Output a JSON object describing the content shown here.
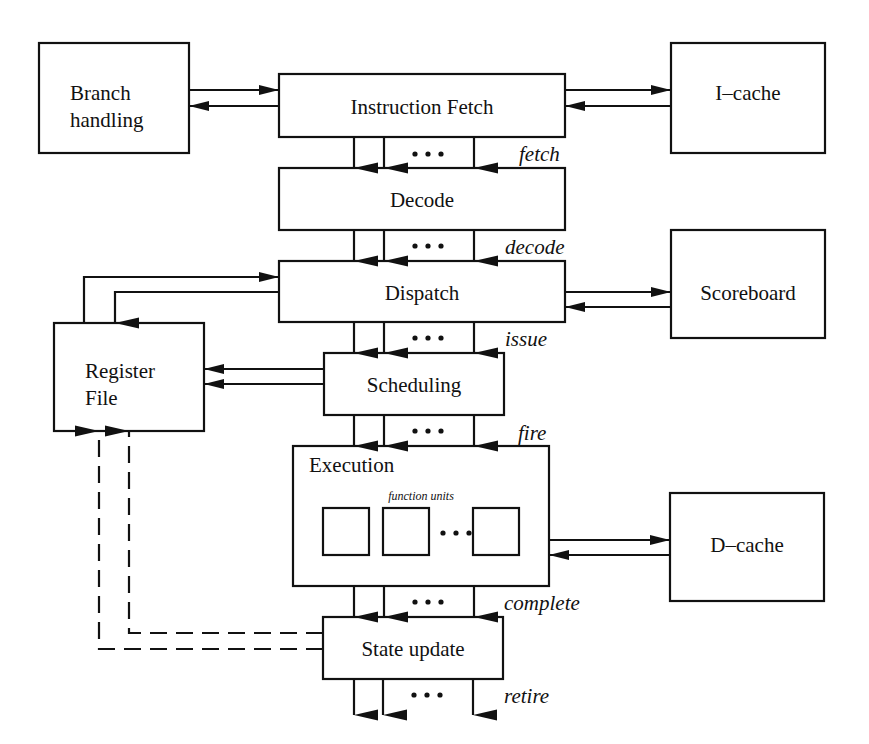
{
  "diagram": {
    "blocks": {
      "branch_handling": {
        "line1": "Branch",
        "line2": "handling"
      },
      "instruction_fetch": {
        "label": "Instruction Fetch"
      },
      "icache": {
        "label": "I–cache"
      },
      "decode": {
        "label": "Decode"
      },
      "dispatch": {
        "label": "Dispatch"
      },
      "scoreboard": {
        "label": "Scoreboard"
      },
      "register_file": {
        "line1": "Register",
        "line2": "File"
      },
      "scheduling": {
        "label": "Scheduling"
      },
      "execution": {
        "label": "Execution",
        "sublabel": "function units"
      },
      "dcache": {
        "label": "D–cache"
      },
      "state_update": {
        "label": "State update"
      }
    },
    "stage_labels": {
      "fetch": "fetch",
      "decode": "decode",
      "issue": "issue",
      "fire": "fire",
      "complete": "complete",
      "retire": "retire"
    },
    "ellipsis": "•••",
    "colors": {
      "stroke": "#111111",
      "background": "#ffffff"
    }
  }
}
